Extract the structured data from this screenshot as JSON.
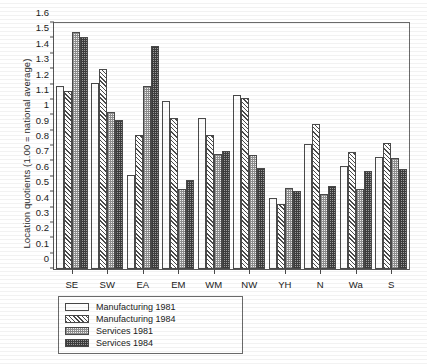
{
  "chart_data": {
    "type": "bar",
    "title": "",
    "xlabel": "",
    "ylabel": "Location quotients (1.00 = national average)",
    "ylim": [
      0,
      1.6
    ],
    "ytick_labels": [
      "0",
      "0.1",
      "0.2",
      "0.3",
      "0.4",
      "0.5",
      "0.6",
      "0.7",
      "0.8",
      "0.9",
      "1",
      "1.1",
      "1.2",
      "1.3",
      "1.4",
      "1.5",
      "1.6"
    ],
    "ytick_values": [
      0,
      0.1,
      0.2,
      0.3,
      0.4,
      0.5,
      0.6,
      0.7,
      0.8,
      0.9,
      1.0,
      1.1,
      1.2,
      1.3,
      1.4,
      1.5,
      1.6
    ],
    "grid": false,
    "legend_position": "below-left",
    "categories": [
      "SE",
      "SW",
      "EA",
      "EM",
      "WM",
      "NW",
      "YH",
      "N",
      "Wa",
      "S"
    ],
    "series": [
      {
        "name": "Manufacturing 1981",
        "pattern": "plain-white",
        "values": [
          1.19,
          1.21,
          0.61,
          1.09,
          0.98,
          1.13,
          0.46,
          0.81,
          0.67,
          0.73
        ]
      },
      {
        "name": "Manufacturing 1984",
        "pattern": "diagonal-hatch",
        "values": [
          1.16,
          1.3,
          0.87,
          0.98,
          0.87,
          1.11,
          0.42,
          0.94,
          0.76,
          0.82
        ]
      },
      {
        "name": "Services 1981",
        "pattern": "light-checker",
        "values": [
          1.54,
          1.02,
          1.19,
          0.52,
          0.75,
          0.74,
          0.53,
          0.49,
          0.52,
          0.72
        ]
      },
      {
        "name": "Services 1984",
        "pattern": "dark-checker",
        "values": [
          1.51,
          0.97,
          1.45,
          0.58,
          0.77,
          0.66,
          0.51,
          0.54,
          0.64,
          0.65
        ]
      }
    ]
  },
  "legend": {
    "items": [
      {
        "label": "Manufacturing 1981"
      },
      {
        "label": "Manufacturing 1984"
      },
      {
        "label": "Services 1981"
      },
      {
        "label": "Services 1984"
      }
    ]
  }
}
